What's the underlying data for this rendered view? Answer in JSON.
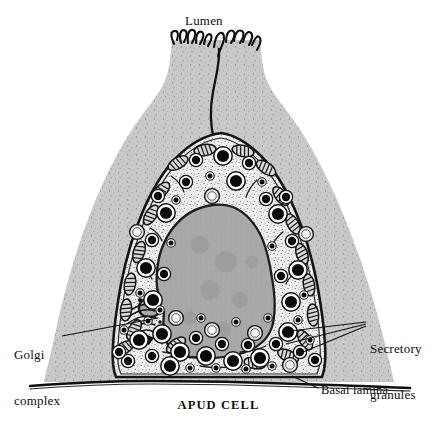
{
  "figure": {
    "caption": "APUD CELL",
    "type": "scientific-illustration"
  },
  "labels": {
    "lumen": "Lumen",
    "golgi_line1": "Golgi",
    "golgi_line2": "complex",
    "secretory_line1": "Secretory",
    "secretory_line2": "granules",
    "basal_lamina": "Basal lamina"
  },
  "structures": [
    {
      "name": "lumen",
      "label": "Lumen",
      "description": "apical space above epithelium"
    },
    {
      "name": "microvilli",
      "label": "",
      "description": "squiggly apical projections into lumen"
    },
    {
      "name": "neighbouring-epithelial-cells",
      "label": "",
      "description": "stippled grey flanking cells"
    },
    {
      "name": "apud-cell-cytoplasm",
      "label": "",
      "description": "pale stippled cytoplasm of APUD cell"
    },
    {
      "name": "nucleus",
      "label": "",
      "description": "large irregular grey nucleus with basal indentation"
    },
    {
      "name": "golgi-complex",
      "label": "Golgi complex",
      "description": "stacked cisternae at left of nucleus"
    },
    {
      "name": "secretory-granules",
      "label": "Secretory granules",
      "description": "dense dark membrane-bound granules, concentrated basally"
    },
    {
      "name": "mitochondria",
      "label": "",
      "description": "elongate organelles with cristae"
    },
    {
      "name": "basal-lamina",
      "label": "Basal lamina",
      "description": "dark line along the cell base"
    }
  ],
  "colors": {
    "background": "#ffffff",
    "ink": "#111111",
    "neighbour_cell": "#c9c9c9",
    "apud_cytoplasm": "#efefef",
    "nucleus": "#a9a9a9",
    "granule": "#0b0b0b",
    "granule_halo": "#ffffff",
    "membrane": "#1a1a1a"
  },
  "counts": {
    "secretory_granules_visible": 62,
    "mitochondria_visible": 20,
    "leader_lines_secretory": 3
  }
}
